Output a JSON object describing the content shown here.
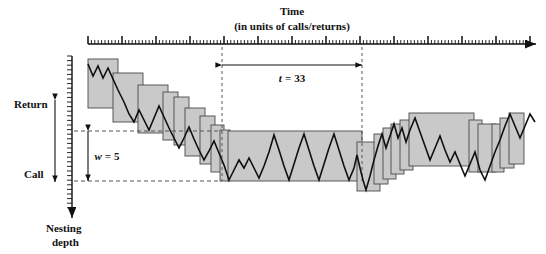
{
  "figure": {
    "width": 546,
    "height": 254,
    "background": "#ffffff"
  },
  "time_axis": {
    "title_line1": "Time",
    "title_line2": "(in units of calls/returns)",
    "x_start": 88,
    "x_end": 536,
    "y": 44,
    "minor_tick_spacing": 3.4,
    "major_every": 10,
    "minor_tick_len": 4,
    "major_tick_len": 8,
    "arrow": "right"
  },
  "depth_axis": {
    "label_line1": "Nesting",
    "label_line2": "depth",
    "top_label": "Return",
    "bottom_label": "Call",
    "x": 72,
    "y_start": 56,
    "y_end": 218,
    "tick_spacing": 4.6,
    "tick_len": 5,
    "arrow": "down",
    "direction_arrow_x": 55,
    "direction_arrow_top": 100,
    "direction_arrow_bottom": 182
  },
  "annotations": {
    "window_width": {
      "symbol": "w",
      "equals": "=",
      "value": "5",
      "label": "w = 5",
      "top_y": 131,
      "bottom_y": 181,
      "arrow_x": 88,
      "dash_x_start": 74,
      "dash_x_end": 222,
      "text_x": 107,
      "text_y": 160
    },
    "time_window": {
      "symbol": "t",
      "equals": "=",
      "value": "33",
      "label": "t = 33",
      "left_x": 222,
      "right_x": 362,
      "arrow_y": 65,
      "text_x": 292,
      "text_y": 82,
      "dash_top_y": 47,
      "dash_bottom_y": 181
    }
  },
  "colors": {
    "fill": "#c9c9c9",
    "stroke": "#4a4a4a",
    "line": "#101010",
    "axis": "#111111",
    "dash": "#555555"
  },
  "chart_data": {
    "type": "area",
    "title": "Time",
    "subtitle": "(in units of calls/returns)",
    "xlabel": "Time (in units of calls/returns)",
    "ylabel": "Nesting depth",
    "grid": false,
    "legend": false,
    "y_direction": "inverted",
    "bands": [
      {
        "x0": 88,
        "x1": 118,
        "top": 59,
        "bottom": 108
      },
      {
        "x0": 113,
        "x1": 143,
        "top": 73,
        "bottom": 122
      },
      {
        "x0": 138,
        "x1": 168,
        "top": 85,
        "bottom": 133
      },
      {
        "x0": 163,
        "x1": 178,
        "top": 92,
        "bottom": 140
      },
      {
        "x0": 174,
        "x1": 189,
        "top": 97,
        "bottom": 145
      },
      {
        "x0": 185,
        "x1": 205,
        "top": 108,
        "bottom": 156
      },
      {
        "x0": 200,
        "x1": 215,
        "top": 116,
        "bottom": 164
      },
      {
        "x0": 211,
        "x1": 224,
        "top": 125,
        "bottom": 172
      },
      {
        "x0": 220,
        "x1": 230,
        "top": 130,
        "bottom": 181
      },
      {
        "x0": 228,
        "x1": 362,
        "top": 131,
        "bottom": 181
      },
      {
        "x0": 357,
        "x1": 380,
        "top": 142,
        "bottom": 191
      },
      {
        "x0": 374,
        "x1": 388,
        "top": 134,
        "bottom": 184
      },
      {
        "x0": 383,
        "x1": 396,
        "top": 128,
        "bottom": 179
      },
      {
        "x0": 391,
        "x1": 404,
        "top": 124,
        "bottom": 174
      },
      {
        "x0": 400,
        "x1": 413,
        "top": 120,
        "bottom": 170
      },
      {
        "x0": 409,
        "x1": 474,
        "top": 113,
        "bottom": 166
      },
      {
        "x0": 469,
        "x1": 482,
        "top": 120,
        "bottom": 172
      },
      {
        "x0": 478,
        "x1": 496,
        "top": 124,
        "bottom": 172
      },
      {
        "x0": 492,
        "x1": 504,
        "top": 124,
        "bottom": 172
      },
      {
        "x0": 500,
        "x1": 514,
        "top": 118,
        "bottom": 168
      },
      {
        "x0": 509,
        "x1": 524,
        "top": 113,
        "bottom": 164
      }
    ],
    "depth_series": [
      [
        88,
        64
      ],
      [
        93,
        76
      ],
      [
        98,
        66
      ],
      [
        103,
        78
      ],
      [
        108,
        68
      ],
      [
        113,
        79
      ],
      [
        118,
        90
      ],
      [
        124,
        102
      ],
      [
        129,
        114
      ],
      [
        134,
        122
      ],
      [
        139,
        110
      ],
      [
        144,
        120
      ],
      [
        149,
        130
      ],
      [
        154,
        118
      ],
      [
        159,
        106
      ],
      [
        164,
        117
      ],
      [
        169,
        128
      ],
      [
        174,
        138
      ],
      [
        179,
        148
      ],
      [
        184,
        138
      ],
      [
        189,
        127
      ],
      [
        194,
        139
      ],
      [
        199,
        150
      ],
      [
        204,
        160
      ],
      [
        209,
        151
      ],
      [
        214,
        141
      ],
      [
        219,
        153
      ],
      [
        224,
        165
      ],
      [
        229,
        180
      ],
      [
        234,
        170
      ],
      [
        239,
        160
      ],
      [
        244,
        168
      ],
      [
        249,
        158
      ],
      [
        254,
        168
      ],
      [
        259,
        178
      ],
      [
        264,
        166
      ],
      [
        269,
        152
      ],
      [
        274,
        135
      ],
      [
        279,
        150
      ],
      [
        284,
        166
      ],
      [
        289,
        180
      ],
      [
        294,
        164
      ],
      [
        299,
        148
      ],
      [
        304,
        134
      ],
      [
        309,
        150
      ],
      [
        314,
        166
      ],
      [
        319,
        180
      ],
      [
        324,
        164
      ],
      [
        329,
        148
      ],
      [
        334,
        134
      ],
      [
        339,
        150
      ],
      [
        344,
        166
      ],
      [
        349,
        180
      ],
      [
        354,
        168
      ],
      [
        357,
        155
      ],
      [
        360,
        168
      ],
      [
        363,
        180
      ],
      [
        366,
        190
      ],
      [
        370,
        176
      ],
      [
        374,
        160
      ],
      [
        378,
        146
      ],
      [
        382,
        134
      ],
      [
        386,
        148
      ],
      [
        390,
        136
      ],
      [
        394,
        124
      ],
      [
        398,
        138
      ],
      [
        402,
        128
      ],
      [
        406,
        142
      ],
      [
        410,
        130
      ],
      [
        415,
        118
      ],
      [
        420,
        132
      ],
      [
        425,
        146
      ],
      [
        430,
        160
      ],
      [
        435,
        148
      ],
      [
        440,
        136
      ],
      [
        445,
        150
      ],
      [
        450,
        162
      ],
      [
        455,
        152
      ],
      [
        460,
        164
      ],
      [
        465,
        176
      ],
      [
        470,
        164
      ],
      [
        475,
        152
      ],
      [
        480,
        170
      ],
      [
        485,
        180
      ],
      [
        490,
        166
      ],
      [
        495,
        152
      ],
      [
        500,
        140
      ],
      [
        505,
        126
      ],
      [
        510,
        114
      ],
      [
        515,
        126
      ],
      [
        520,
        138
      ],
      [
        525,
        126
      ],
      [
        530,
        114
      ],
      [
        535,
        122
      ]
    ]
  }
}
